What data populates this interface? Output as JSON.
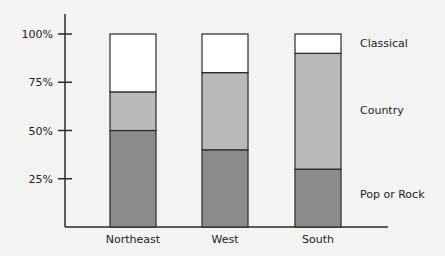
{
  "chart_data": {
    "type": "bar",
    "stacked": true,
    "title": "",
    "xlabel": "",
    "ylabel": "",
    "ylim": [
      0,
      100
    ],
    "yticks": [
      "25%",
      "50%",
      "75%",
      "100%"
    ],
    "ytick_values": [
      25,
      50,
      75,
      100
    ],
    "grid": false,
    "legend_position": "right, labels aligned to South bar segments",
    "categories": [
      "Northeast",
      "West",
      "South"
    ],
    "series": [
      {
        "name": "Pop or Rock",
        "color": "#8c8c8c",
        "values": [
          50,
          40,
          30
        ]
      },
      {
        "name": "Country",
        "color": "#b9b9b9",
        "values": [
          20,
          40,
          60
        ]
      },
      {
        "name": "Classical",
        "color": "#ffffff",
        "values": [
          30,
          20,
          10
        ]
      }
    ]
  },
  "legend": {
    "classical": "Classical",
    "country": "Country",
    "pop_or_rock": "Pop or Rock"
  }
}
